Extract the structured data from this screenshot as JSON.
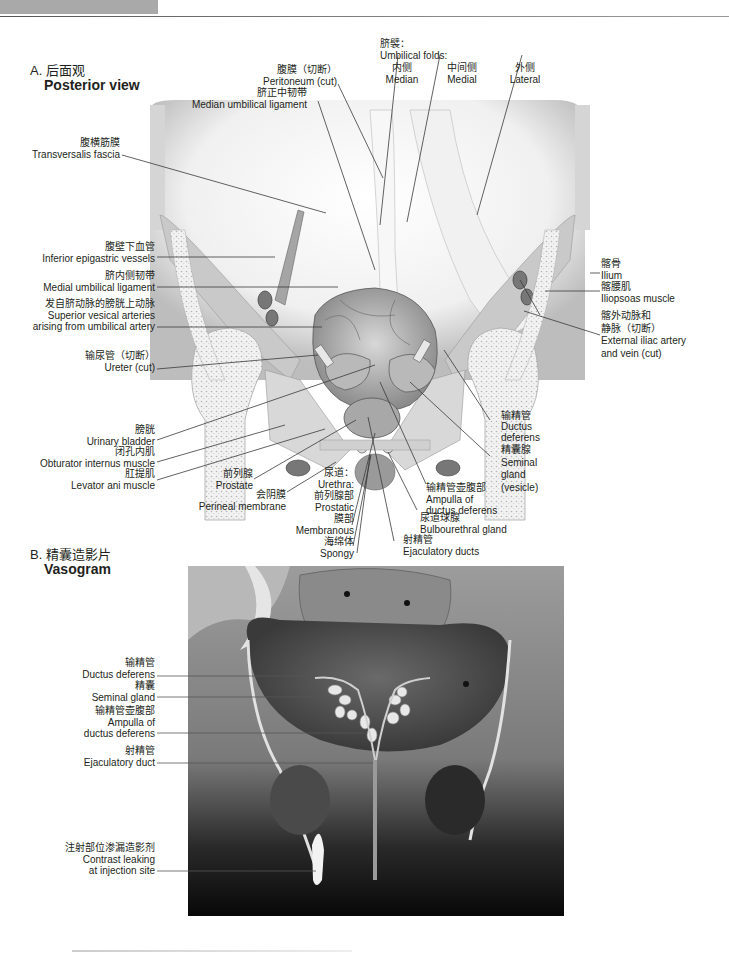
{
  "header": {
    "decorative_bar": true
  },
  "section_a": {
    "label_zh": "A. 后面观",
    "label_en": "Posterior view",
    "labels": {
      "peritoneum": {
        "zh": "腹膜（切断）",
        "en": "Peritoneum (cut)"
      },
      "median_umbilical_ligament": {
        "zh": "脐正中韧带",
        "en": "Median umbilical ligament"
      },
      "umbilical_folds": {
        "zh": "脐襞：",
        "en": "Umbilical folds:"
      },
      "fold_median": {
        "zh": "内侧",
        "en": "Median"
      },
      "fold_medial": {
        "zh": "中间侧",
        "en": "Medial"
      },
      "fold_lateral": {
        "zh": "外侧",
        "en": "Lateral"
      },
      "transversalis_fascia": {
        "zh": "腹横筋膜",
        "en": "Transversalis fascia"
      },
      "inferior_epigastric": {
        "zh": "腹壁下血管",
        "en": "Inferior epigastric vessels"
      },
      "medial_umbilical_ligament": {
        "zh": "脐内侧韧带",
        "en": "Medial umbilical ligament"
      },
      "superior_vesical": {
        "zh": "发自脐动脉的膀胱上动脉",
        "en1": "Superior vesical arteries",
        "en2": "arising from umbilical artery"
      },
      "ureter": {
        "zh": "输尿管（切断）",
        "en": "Ureter (cut)"
      },
      "urinary_bladder": {
        "zh": "膀胱",
        "en": "Urinary bladder"
      },
      "obturator_internus": {
        "zh": "闭孔内肌",
        "en": "Obturator internus muscle"
      },
      "levator_ani": {
        "zh": "肛提肌",
        "en": "Levator ani muscle"
      },
      "prostate": {
        "zh": "前列腺",
        "en": "Prostate"
      },
      "perineal_membrane": {
        "zh": "会阴膜",
        "en": "Perineal membrane"
      },
      "urethra": {
        "zh": "尿道：",
        "en": "Urethra:"
      },
      "prostatic": {
        "zh": "前列腺部",
        "en": "Prostatic"
      },
      "membranous": {
        "zh": "膜部",
        "en": "Membranous"
      },
      "spongy": {
        "zh": "海绵体",
        "en": "Spongy"
      },
      "ilium": {
        "zh": "髂骨",
        "en": "Ilium"
      },
      "iliopsoas": {
        "zh": "髂腰肌",
        "en": "Iliopsoas muscle"
      },
      "external_iliac": {
        "zh1": "髂外动脉和",
        "zh2": "静脉（切断）",
        "en1": "External iliac artery",
        "en2": "and vein (cut)"
      },
      "ductus_deferens": {
        "zh": "输精管",
        "en1": "Ductus",
        "en2": "deferens"
      },
      "seminal_gland": {
        "zh": "精囊腺",
        "en1": "Seminal",
        "en2": "gland",
        "en3": "(vesicle)"
      },
      "ampulla": {
        "zh": "输精管壶腹部",
        "en1": "Ampulla of",
        "en2": "ductus deferens"
      },
      "bulbourethral": {
        "zh": "尿道球腺",
        "en": "Bulbourethral gland"
      },
      "ejaculatory_ducts": {
        "zh": "射精管",
        "en": "Ejaculatory ducts"
      }
    }
  },
  "section_b": {
    "label_zh": "B. 精囊造影片",
    "label_en": "Vasogram",
    "labels": {
      "ductus_deferens": {
        "zh": "输精管",
        "en": "Ductus deferens"
      },
      "seminal_gland": {
        "zh": "精囊",
        "en": "Seminal gland"
      },
      "ampulla": {
        "zh": "输精管壶腹部",
        "en1": "Ampulla of",
        "en2": "ductus deferens"
      },
      "ejaculatory_duct": {
        "zh": "射精管",
        "en": "Ejaculatory duct"
      },
      "contrast_leak": {
        "zh": "注射部位渗漏造影剂",
        "en1": "Contrast leaking",
        "en2": "at injection site"
      }
    }
  },
  "colors": {
    "text": "#231f20",
    "leader": "#3a3a3a",
    "tissue_light": "#e6e6e6",
    "tissue_mid": "#c8c8c8",
    "xray_dark": "#1a1a1a"
  }
}
